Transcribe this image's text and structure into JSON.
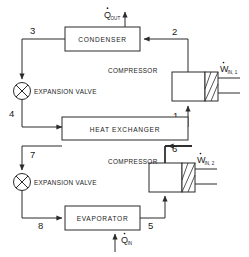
{
  "diagram": {
    "top_cut_text": "",
    "components": [
      {
        "id": "condenser",
        "label": "CONDENSER"
      },
      {
        "id": "heat-exchanger",
        "label": "HEAT EXCHANGER"
      },
      {
        "id": "evaporator",
        "label": "EVAPORATOR"
      },
      {
        "id": "compressor-1",
        "label": "COMPRESSOR"
      },
      {
        "id": "compressor-2",
        "label": "COMPRESSOR"
      },
      {
        "id": "expansion-valve-1",
        "label": "EXPANSION VALVE"
      },
      {
        "id": "expansion-valve-2",
        "label": "EXPANSION VALVE"
      }
    ],
    "energy_flows": [
      {
        "id": "q-out",
        "symbol": "Q",
        "subscript": "OUT",
        "dot": true,
        "direction": "out"
      },
      {
        "id": "q-in",
        "symbol": "Q",
        "subscript": "IN",
        "dot": true,
        "direction": "in"
      },
      {
        "id": "w-in-1",
        "symbol": "W",
        "subscript": "IN, 1",
        "dot": true,
        "direction": "in"
      },
      {
        "id": "w-in-2",
        "symbol": "W",
        "subscript": "IN, 2",
        "dot": true,
        "direction": "in"
      }
    ],
    "state_points": [
      {
        "id": "state-1",
        "label": "1"
      },
      {
        "id": "state-2",
        "label": "2"
      },
      {
        "id": "state-3",
        "label": "3"
      },
      {
        "id": "state-4",
        "label": "4"
      },
      {
        "id": "state-5",
        "label": "5"
      },
      {
        "id": "state-6",
        "label": "6"
      },
      {
        "id": "state-7",
        "label": "7"
      },
      {
        "id": "state-8",
        "label": "8"
      }
    ],
    "colors": {
      "line": "#2b2b2b",
      "text": "#1a1a1a",
      "background": "#ffffff"
    }
  }
}
